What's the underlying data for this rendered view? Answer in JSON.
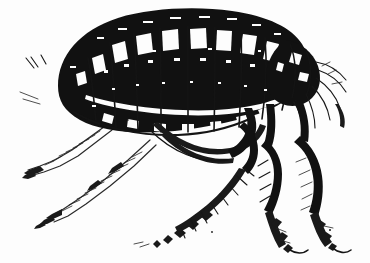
{
  "image": {
    "title": "Flea engraving illustration",
    "subject": "flea",
    "style": "black and white woodcut engraving",
    "orientation": "head to the right, body in left profile",
    "background_color": "#fdfdfd",
    "ink_color": "#111111",
    "width": 370,
    "height": 263
  },
  "anatomy": {
    "abdomen": {
      "label": "segmented abdomen",
      "segment_count": 9,
      "description": "large arched oval body filled with solid black, crossed by near-vertical segment divisions with white highlight patches"
    },
    "thorax": {
      "label": "thorax",
      "description": "narrower dark region between abdomen and head on the right"
    },
    "head": {
      "label": "head",
      "description": "small rounded dark head at right end bearing antennae and mouthparts"
    },
    "mouthparts": {
      "label": "mouthparts and antennae",
      "description": "fine bristle-like appendages sweeping right and down from the head"
    },
    "rear_bristles": {
      "label": "rear bristles",
      "count": 2,
      "description": "two short hash marks to the upper left of the abdomen tip"
    },
    "coxa_hook": {
      "label": "curved coxa",
      "description": "bold crescent hook under the belly"
    },
    "legs": [
      {
        "id": "near-foreleg",
        "label": "near foreleg",
        "side": "far",
        "rendering": "outline hatched",
        "direction": "down-left"
      },
      {
        "id": "far-foreleg",
        "label": "far foreleg",
        "side": "far",
        "rendering": "outline hatched",
        "direction": "down-left"
      },
      {
        "id": "midleg",
        "label": "middle leg",
        "side": "near",
        "rendering": "solid black jointed",
        "direction": "down-left with bristle row"
      },
      {
        "id": "hindleg-inner",
        "label": "inner hind leg",
        "side": "near",
        "rendering": "solid black jointed",
        "direction": "down"
      },
      {
        "id": "hindleg-outer",
        "label": "outer hind leg",
        "side": "near",
        "rendering": "solid black jointed",
        "direction": "down-right"
      }
    ]
  }
}
